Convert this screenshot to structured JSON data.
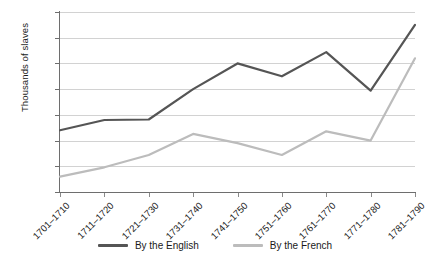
{
  "chart_data": {
    "type": "line",
    "title": "",
    "xlabel": "",
    "ylabel": "Thousands of slaves",
    "ylim": [
      0,
      350
    ],
    "ytick_step": 50,
    "yticks": [
      0,
      50,
      100,
      150,
      200,
      250,
      300,
      350
    ],
    "grid": "horizontal",
    "legend_position": "bottom-center",
    "categories": [
      "1701–1710",
      "1711–1720",
      "1721–1730",
      "1731–1740",
      "1741–1750",
      "1751–1760",
      "1761–1770",
      "1771–1780",
      "1781–1790"
    ],
    "series": [
      {
        "name": "By the English",
        "color": "#555555",
        "values": [
          120,
          140,
          141,
          200,
          250,
          225,
          272,
          197,
          325
        ]
      },
      {
        "name": "By the French",
        "color": "#bcbcbc",
        "values": [
          30,
          48,
          72,
          113,
          95,
          72,
          118,
          100,
          260
        ]
      }
    ]
  },
  "legend": {
    "items": [
      {
        "label": "By the English",
        "color": "#555555"
      },
      {
        "label": "By the French",
        "color": "#bcbcbc"
      }
    ]
  },
  "axes": {
    "y_title": "Thousands of slaves"
  }
}
